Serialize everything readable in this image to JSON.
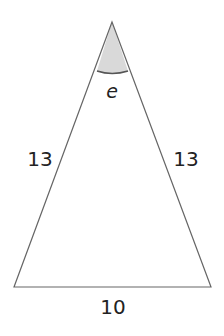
{
  "diagram": {
    "type": "isosceles-triangle",
    "sides": {
      "left": "13",
      "right": "13",
      "base": "10"
    },
    "angle_label": "e",
    "angle_fill": "#d9d9d9",
    "stroke_color": "#666666"
  }
}
